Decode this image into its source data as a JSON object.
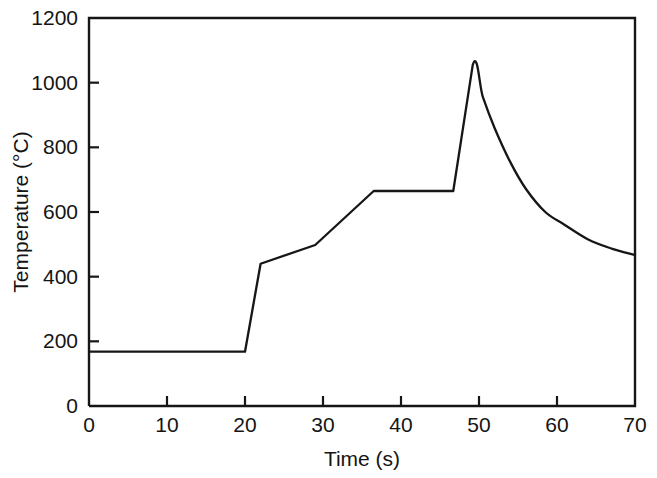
{
  "chart_data": {
    "type": "line",
    "title": "",
    "xlabel": "Time (s)",
    "ylabel": "Temperature (°C)",
    "xlim": [
      0,
      70
    ],
    "ylim": [
      0,
      1200
    ],
    "xticks": [
      0,
      10,
      20,
      30,
      40,
      50,
      60,
      70
    ],
    "yticks": [
      0,
      200,
      400,
      600,
      800,
      1000,
      1200
    ],
    "xtick_labels": [
      "0",
      "10",
      "20",
      "30",
      "40",
      "50",
      "60",
      "70"
    ],
    "ytick_labels": [
      "0",
      "200",
      "400",
      "600",
      "800",
      "1000",
      "1200"
    ],
    "grid": false,
    "legend": null,
    "line_color": "#161616",
    "frame_color": "#161616",
    "background_color": "#ffffff",
    "series": [
      {
        "name": "Temperature profile",
        "x": [
          0,
          20,
          22,
          29,
          36.5,
          46.7,
          49.2,
          50.5,
          52,
          54,
          56,
          58.5,
          61,
          64,
          67,
          70
        ],
        "y": [
          168,
          168,
          440,
          498,
          665,
          665,
          1055,
          955,
          860,
          755,
          672,
          600,
          560,
          515,
          487,
          467
        ]
      }
    ],
    "annotations": [
      {
        "label": "initial plateau",
        "x_range": [
          0,
          20
        ],
        "value": 168
      },
      {
        "label": "rapid rise",
        "x_range": [
          20,
          22
        ],
        "value": 440
      },
      {
        "label": "second plateau",
        "x_range": [
          36.5,
          46.7
        ],
        "value": 665
      },
      {
        "label": "peak",
        "x": 49.2,
        "value": 1055
      },
      {
        "label": "end value",
        "x": 70,
        "value": 467
      }
    ]
  },
  "axes": {
    "x_axis_label": "Time (s)",
    "y_axis_label": "Temperature (°C)"
  },
  "ticks": {
    "y": [
      {
        "label": "1200",
        "value": 1200
      },
      {
        "label": "1000",
        "value": 1000
      },
      {
        "label": "800",
        "value": 800
      },
      {
        "label": "600",
        "value": 600
      },
      {
        "label": "400",
        "value": 400
      },
      {
        "label": "200",
        "value": 200
      },
      {
        "label": "0",
        "value": 0
      }
    ],
    "x": [
      {
        "label": "0",
        "value": 0
      },
      {
        "label": "10",
        "value": 10
      },
      {
        "label": "20",
        "value": 20
      },
      {
        "label": "30",
        "value": 30
      },
      {
        "label": "40",
        "value": 40
      },
      {
        "label": "50",
        "value": 50
      },
      {
        "label": "60",
        "value": 60
      },
      {
        "label": "70",
        "value": 70
      }
    ]
  }
}
